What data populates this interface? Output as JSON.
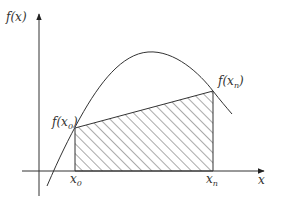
{
  "diagram": {
    "type": "trapezoid-rule-illustration",
    "colors": {
      "stroke": "#333333",
      "hatch": "#555555",
      "background": "#ffffff"
    },
    "axes": {
      "y_label": {
        "base": "f(x)"
      },
      "x_label": {
        "base": "x"
      }
    },
    "points": {
      "start": {
        "x_label_base": "x",
        "x_label_sub": "0",
        "f_label_prefix": "f(x",
        "f_label_sub": "0",
        "f_label_suffix": ")"
      },
      "end": {
        "x_label_base": "x",
        "x_label_sub": "n",
        "f_label_prefix": "f(x",
        "f_label_sub": "n",
        "f_label_suffix": ")"
      }
    },
    "shaded_region": {
      "description": "Trapezoid under the chord from f(x0) to f(xn), hatched",
      "pattern": "diagonal-hatch"
    },
    "curve": {
      "description": "Smooth concave function rising to a maximum then decreasing"
    }
  }
}
